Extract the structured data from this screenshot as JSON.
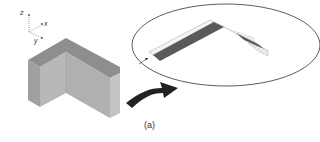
{
  "figure": {
    "caption": "(a)",
    "axes": {
      "z": "z",
      "x": "x",
      "y": "y"
    },
    "colors": {
      "block_front": "#b4b4b4",
      "block_side": "#a4a4a4",
      "block_top": "#909090",
      "dark_band": "#5a5a5a",
      "hatched_band": "#eeeeee",
      "arrow": "#222222",
      "ellipse_stroke": "#333333"
    }
  }
}
